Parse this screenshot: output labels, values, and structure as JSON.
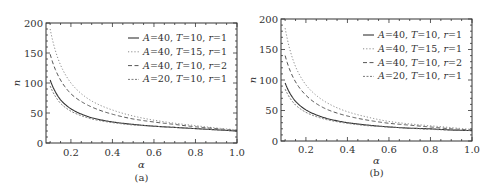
{
  "chart_data": [
    {
      "type": "line",
      "panel": "a",
      "caption": "(a)",
      "xlabel": "α",
      "ylabel": "n",
      "xlim": [
        0.08,
        1.0
      ],
      "ylim": [
        0,
        200
      ],
      "xticks": [
        0.2,
        0.4,
        0.6,
        0.8,
        1.0
      ],
      "xtick_labels": [
        "0.2",
        "0.4",
        "0.6",
        "0.8",
        "1.0"
      ],
      "yticks": [
        0,
        50,
        100,
        150,
        200
      ],
      "ytick_labels": [
        "0",
        "50",
        "100",
        "150",
        "200"
      ],
      "grid": false,
      "legend_position": "upper right",
      "x": [
        0.1,
        0.15,
        0.2,
        0.3,
        0.4,
        0.5,
        0.6,
        0.7,
        0.8,
        0.9,
        1.0
      ],
      "series": [
        {
          "name": "A=40, T=10, r=1",
          "style": "solid",
          "values": [
            105,
            72,
            57,
            42,
            35,
            31,
            28,
            26,
            24,
            22,
            20
          ]
        },
        {
          "name": "A=40, T=15, r=1",
          "style": "dotted",
          "values": [
            190,
            130,
            100,
            70,
            55,
            45,
            38,
            33,
            29,
            25,
            22
          ]
        },
        {
          "name": "A=40, T=10, r=2",
          "style": "dashed",
          "values": [
            148,
            105,
            82,
            60,
            48,
            40,
            35,
            31,
            27,
            24,
            21
          ]
        },
        {
          "name": "A=20, T=10, r=1",
          "style": "dashdot",
          "values": [
            95,
            66,
            53,
            40,
            34,
            30,
            28,
            26,
            24,
            22,
            20
          ]
        }
      ]
    },
    {
      "type": "line",
      "panel": "b",
      "caption": "(b)",
      "xlabel": "α",
      "ylabel": "n",
      "xlim": [
        0.08,
        1.0
      ],
      "ylim": [
        0,
        200
      ],
      "xticks": [
        0.2,
        0.4,
        0.6,
        0.8,
        1.0
      ],
      "xtick_labels": [
        "0.2",
        "0.4",
        "0.6",
        "0.8",
        "1.0"
      ],
      "yticks": [
        0,
        50,
        100,
        150,
        200
      ],
      "ytick_labels": [
        "0",
        "50",
        "100",
        "150",
        "200"
      ],
      "grid": false,
      "legend_position": "upper right",
      "x": [
        0.1,
        0.15,
        0.2,
        0.3,
        0.4,
        0.5,
        0.6,
        0.7,
        0.8,
        0.9,
        1.0
      ],
      "series": [
        {
          "name": "A=40, T=10, r=1",
          "style": "solid",
          "values": [
            95,
            65,
            51,
            37,
            30,
            26,
            23,
            21,
            20,
            18,
            17
          ]
        },
        {
          "name": "A=40, T=15, r=1",
          "style": "dotted",
          "values": [
            185,
            122,
            92,
            63,
            48,
            39,
            32,
            28,
            25,
            22,
            19
          ]
        },
        {
          "name": "A=40, T=10, r=2",
          "style": "dashed",
          "values": [
            140,
            97,
            75,
            52,
            41,
            34,
            29,
            26,
            23,
            20,
            18
          ]
        },
        {
          "name": "A=20, T=10, r=1",
          "style": "dashdot",
          "values": [
            85,
            59,
            47,
            35,
            29,
            25,
            23,
            21,
            19,
            18,
            17
          ]
        }
      ]
    }
  ]
}
